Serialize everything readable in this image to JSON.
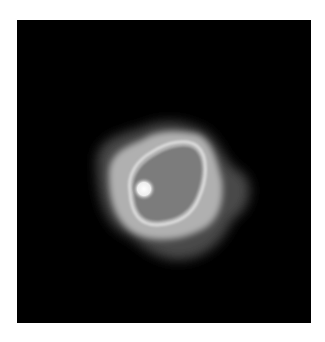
{
  "image": {
    "description": "grayscale blob with bright ring and bright spot on black background",
    "colors": {
      "background": "#000000",
      "page": "#ffffff",
      "halo": "#5a5a5a",
      "outer_body": "#b4b4b4",
      "ring": "#d8d8d8",
      "inner_region": "#808080",
      "bright_spot": "#ffffff"
    }
  }
}
